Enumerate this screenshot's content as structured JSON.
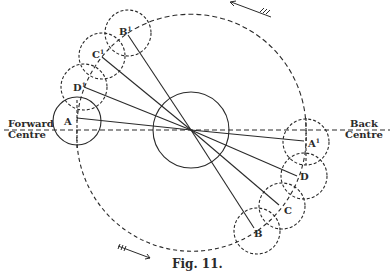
{
  "figure": {
    "caption": "Fig. 11.",
    "colors": {
      "ink": "#2a2a2a",
      "background": "#ffffff"
    }
  },
  "labels": {
    "forward": {
      "line1": "Forward",
      "line2": "Centre"
    },
    "back": {
      "line1": "Back",
      "line2": "Centre"
    },
    "points": {
      "A": "A",
      "D1": "D",
      "C1": "C",
      "B1": "B",
      "A1": "A",
      "D": "D",
      "C": "C",
      "B": "B",
      "prime": "1"
    }
  },
  "diagram": {
    "crank_centre": [
      191,
      130
    ],
    "crank_circle_radius": 38,
    "orbit_radius": 115,
    "pin_circle_radius": 23,
    "positions": [
      {
        "name": "A",
        "center": [
          77,
          121
        ],
        "style": "solid"
      },
      {
        "name": "D1",
        "center": [
          84,
          87
        ],
        "style": "dashed"
      },
      {
        "name": "C1",
        "center": [
          102,
          56
        ],
        "style": "dashed"
      },
      {
        "name": "B1",
        "center": [
          128,
          33
        ],
        "style": "dashed"
      },
      {
        "name": "A1",
        "center": [
          306,
          142
        ],
        "style": "dashed"
      },
      {
        "name": "D",
        "center": [
          304,
          176
        ],
        "style": "dashed"
      },
      {
        "name": "C",
        "center": [
          282,
          206
        ],
        "style": "dashed"
      },
      {
        "name": "B",
        "center": [
          257,
          231
        ],
        "style": "dashed"
      }
    ],
    "rotation_arrows": [
      "counter-clockwise top",
      "clockwise bottom"
    ]
  }
}
